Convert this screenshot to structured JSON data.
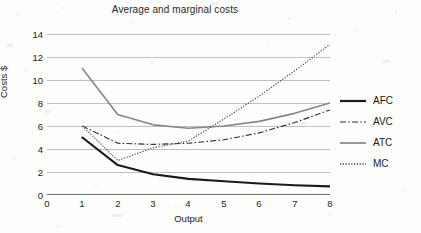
{
  "figure": {
    "background_color": "#fdfdfc",
    "axis_color": "#6f6f6f",
    "grid_color": "#b9b9b9"
  },
  "chart_data": {
    "type": "line",
    "title": "Average and marginal costs",
    "xlabel": "Output",
    "ylabel": "Costs $",
    "x": [
      1,
      2,
      3,
      4,
      5,
      6,
      7,
      8
    ],
    "xlim": [
      0,
      8
    ],
    "ylim": [
      0,
      14
    ],
    "xticks": [
      0,
      1,
      2,
      3,
      4,
      5,
      6,
      7,
      8
    ],
    "yticks": [
      0,
      2,
      4,
      6,
      8,
      10,
      12,
      14
    ],
    "grid": "horizontal",
    "legend_position": "right",
    "series": [
      {
        "name": "AFC",
        "values": [
          5.0,
          2.6,
          1.8,
          1.4,
          1.2,
          1.0,
          0.85,
          0.75
        ],
        "color": "#1a1a1a",
        "width": 2.1,
        "dash": "none",
        "style": "solid-thick"
      },
      {
        "name": "AVC",
        "values": [
          6.0,
          4.5,
          4.4,
          4.5,
          4.8,
          5.4,
          6.3,
          7.4
        ],
        "color": "#2e2e2e",
        "width": 1.1,
        "dash": "6,2.2,1.6,2.2",
        "style": "dash-dot"
      },
      {
        "name": "ATC",
        "values": [
          11.0,
          7.0,
          6.1,
          5.8,
          6.0,
          6.4,
          7.1,
          8.0
        ],
        "color": "#868686",
        "width": 1.6,
        "dash": "none",
        "style": "solid-gray"
      },
      {
        "name": "MC",
        "values": [
          6.0,
          3.0,
          4.1,
          4.7,
          6.6,
          8.6,
          10.8,
          13.1
        ],
        "color": "#4a4a4a",
        "width": 1.1,
        "dash": "1.3,1.5",
        "style": "dotted"
      }
    ]
  },
  "legend": {
    "items": [
      {
        "label": "AFC"
      },
      {
        "label": "AVC"
      },
      {
        "label": "ATC"
      },
      {
        "label": "MC"
      }
    ]
  }
}
